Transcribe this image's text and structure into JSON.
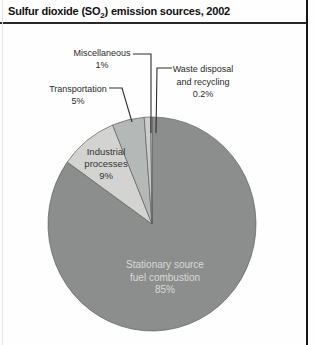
{
  "title": {
    "prefix": "Sulfur dioxide (SO",
    "subscript": "2",
    "suffix": ") emission sources, 2002"
  },
  "chart_data": {
    "type": "pie",
    "title": "Sulfur dioxide (SO2) emission sources, 2002",
    "direction": "clockwise",
    "start_angle_deg": -90,
    "legend": "none (direct labels with leader lines)",
    "slice_stroke": "#5f5f5d",
    "slices": [
      {
        "id": "stationary",
        "label": "Stationary source fuel combustion",
        "value_pct": 85,
        "display": "85%",
        "color": "#8b8e8c"
      },
      {
        "id": "industrial",
        "label": "Industrial processes",
        "value_pct": 9,
        "display": "9%",
        "color": "#d3d3d1"
      },
      {
        "id": "transportation",
        "label": "Transportation",
        "value_pct": 5,
        "display": "5%",
        "color": "#b4b8b6"
      },
      {
        "id": "miscellaneous",
        "label": "Miscellaneous",
        "value_pct": 1,
        "display": "1%",
        "color": "#cccccc"
      },
      {
        "id": "waste",
        "label": "Waste disposal and recycling",
        "value_pct": 0.2,
        "display": "0.2%",
        "color": "#e6e6e6"
      }
    ]
  },
  "labels": {
    "miscellaneous": {
      "lines": [
        "Miscellaneous",
        "1%"
      ]
    },
    "waste": {
      "lines": [
        "Waste disposal",
        "and recycling",
        "0.2%"
      ]
    },
    "transportation": {
      "lines": [
        "Transportation",
        "5%"
      ]
    },
    "industrial": {
      "lines": [
        "Industrial",
        "processes",
        "9%"
      ]
    },
    "stationary": {
      "lines": [
        "Stationary source",
        "fuel combustion",
        "85%"
      ]
    }
  }
}
